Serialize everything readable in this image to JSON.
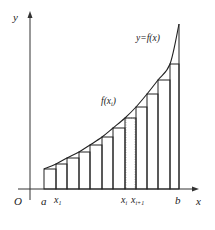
{
  "diagram": {
    "axes": {
      "origin_label": "O",
      "x_label": "x",
      "y_label": "y"
    },
    "curve_label": "y=f(x)",
    "sample_label": "f(x_i)",
    "tick_labels": {
      "a": "a",
      "x1": "x",
      "x1_sub": "1",
      "xi": "x",
      "xi_sub": "i",
      "xi1": "x",
      "xi1_sub": "i+1",
      "b": "b"
    },
    "partition_x": [
      44,
      56,
      67,
      79,
      90,
      102,
      113,
      125,
      136,
      147,
      158,
      170,
      179
    ],
    "step_heights_y": [
      169,
      164,
      158,
      152,
      145,
      137,
      128,
      118,
      107,
      94,
      80,
      64,
      44
    ],
    "curve_end_y": 24,
    "highlighted_strip_index": 7,
    "colors": {
      "line": "#222222",
      "axis": "#333333",
      "strip": "#c8c8c8"
    }
  }
}
